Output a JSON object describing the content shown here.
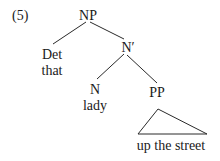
{
  "example_number": "(5)",
  "tree": {
    "root": {
      "label": "NP"
    },
    "det": {
      "label": "Det",
      "word": "that"
    },
    "nbar": {
      "label": "N′"
    },
    "n": {
      "label": "N",
      "word": "lady"
    },
    "pp": {
      "label": "PP",
      "phrase": "up the street"
    }
  },
  "colors": {
    "text": "#1a1a1a",
    "lines": "#2a2a2a",
    "background": "#ffffff"
  }
}
